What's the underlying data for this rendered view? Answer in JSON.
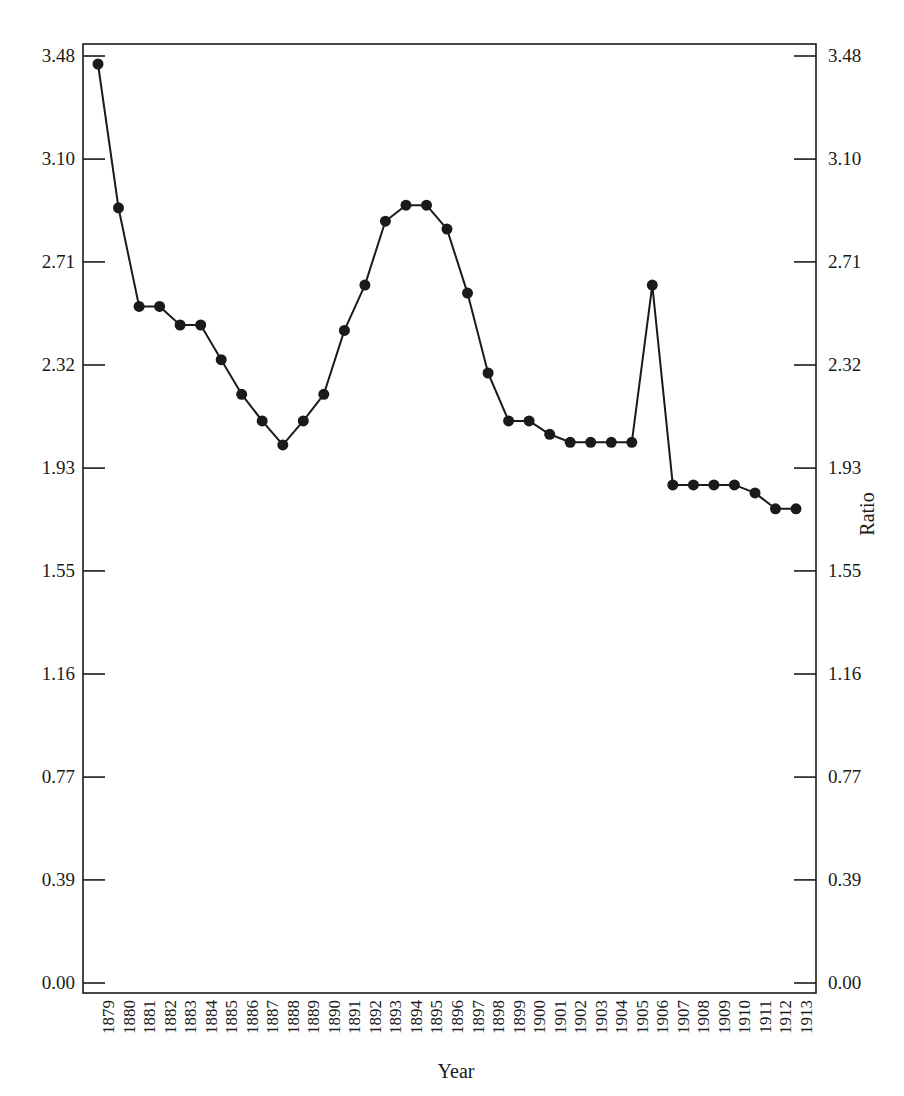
{
  "chart_data": {
    "type": "line",
    "title": "",
    "xlabel": "Year",
    "ylabel": "Ratio",
    "ylim": [
      0.0,
      3.48
    ],
    "y_ticks": [
      "0.00",
      "0.39",
      "0.77",
      "1.16",
      "1.55",
      "1.93",
      "2.32",
      "2.71",
      "3.10",
      "3.48"
    ],
    "y_tick_values": [
      0.0,
      0.387,
      0.773,
      1.16,
      1.547,
      1.933,
      2.32,
      2.707,
      3.093,
      3.48
    ],
    "grid": false,
    "legend": null,
    "markers": "filled-circle",
    "mirror_y_axis_right": true,
    "categories": [
      "1879",
      "1880",
      "1881",
      "1882",
      "1883",
      "1884",
      "1885",
      "1886",
      "1887",
      "1888",
      "1889",
      "1890",
      "1891",
      "1892",
      "1893",
      "1894",
      "1895",
      "1896",
      "1897",
      "1898",
      "1899",
      "1900",
      "1901",
      "1902",
      "1903",
      "1904",
      "1905",
      "1906",
      "1907",
      "1908",
      "1909",
      "1910",
      "1911",
      "1912",
      "1913"
    ],
    "series": [
      {
        "name": "Ratio",
        "color": "#1a1a1a",
        "values": [
          3.45,
          2.91,
          2.54,
          2.54,
          2.47,
          2.47,
          2.34,
          2.21,
          2.11,
          2.02,
          2.11,
          2.21,
          2.45,
          2.62,
          2.86,
          2.92,
          2.92,
          2.83,
          2.59,
          2.29,
          2.11,
          2.11,
          2.06,
          2.03,
          2.03,
          2.03,
          2.03,
          2.62,
          1.87,
          1.87,
          1.87,
          1.87,
          1.84,
          1.78,
          1.78
        ]
      }
    ]
  },
  "axes": {
    "x_title": "Year",
    "right_title": "Ratio"
  }
}
